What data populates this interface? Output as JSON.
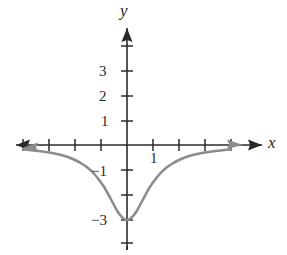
{
  "figure": {
    "kind": "cartesian-function-graph",
    "background_color": "#ffffff",
    "axis_color": "#2b2b2b",
    "curve_color": "#8c8c8c"
  },
  "axes": {
    "x_axis_label": "x",
    "y_axis_label": "y",
    "x_label_italic": true,
    "y_label_italic": true,
    "arrows": "both-ends-both-axes"
  },
  "ticks": {
    "y_labels": [
      "3",
      "2",
      "1",
      "−1",
      "−3"
    ],
    "x_labels": [
      "1"
    ]
  },
  "chart_data": {
    "type": "line",
    "title": "",
    "xlabel": "x",
    "ylabel": "y",
    "grid": false,
    "legend": null,
    "xlim": [
      -4.2,
      4.2
    ],
    "ylim": [
      -4.3,
      4.3
    ],
    "x_ticks": [
      -4,
      -3,
      -2,
      -1,
      1,
      2,
      3,
      4
    ],
    "x_tick_labels": [
      "",
      "",
      "",
      "",
      "1",
      "",
      "",
      ""
    ],
    "y_ticks": [
      -4,
      -3,
      -2,
      -1,
      1,
      2,
      3,
      4
    ],
    "y_tick_labels": [
      "",
      "−3",
      "",
      "−1",
      "1",
      "2",
      "3",
      ""
    ],
    "series": [
      {
        "name": "y = -3/(x^2 + 1)",
        "color": "#8c8c8c",
        "arrow_start": true,
        "arrow_end": true,
        "x": [
          -4.0,
          -3.75,
          -3.5,
          -3.25,
          -3.0,
          -2.75,
          -2.5,
          -2.25,
          -2.0,
          -1.75,
          -1.5,
          -1.25,
          -1.0,
          -0.875,
          -0.75,
          -0.625,
          -0.5,
          -0.375,
          -0.25,
          -0.125,
          0.0,
          0.125,
          0.25,
          0.375,
          0.5,
          0.625,
          0.75,
          0.875,
          1.0,
          1.25,
          1.5,
          1.75,
          2.0,
          2.25,
          2.5,
          2.75,
          3.0,
          3.25,
          3.5,
          3.75,
          4.0
        ],
        "y": [
          -0.18,
          -0.2,
          -0.23,
          -0.26,
          -0.3,
          -0.35,
          -0.41,
          -0.49,
          -0.6,
          -0.74,
          -0.92,
          -1.17,
          -1.5,
          -1.69,
          -1.92,
          -2.16,
          -2.4,
          -2.64,
          -2.82,
          -2.95,
          -3.0,
          -2.95,
          -2.82,
          -2.64,
          -2.4,
          -2.16,
          -1.92,
          -1.69,
          -1.5,
          -1.17,
          -0.92,
          -0.74,
          -0.6,
          -0.49,
          -0.41,
          -0.35,
          -0.3,
          -0.26,
          -0.23,
          -0.2,
          -0.18
        ]
      }
    ],
    "annotations": [
      {
        "text": "minimum at (0, −3)",
        "x": 0,
        "y": -3
      },
      {
        "text": "horizontal asymptote y = 0",
        "x": 4,
        "y": 0
      }
    ]
  }
}
